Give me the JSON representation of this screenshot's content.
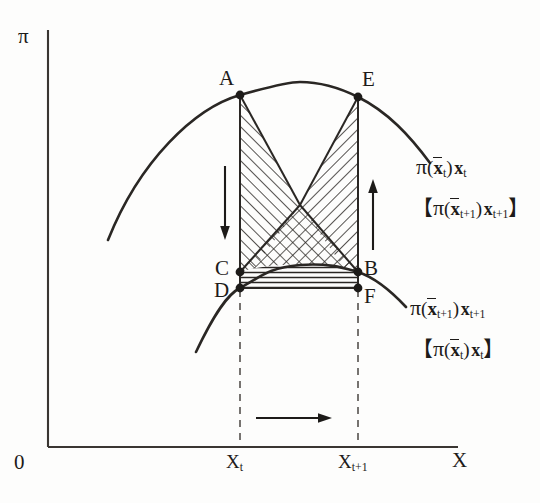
{
  "figure": {
    "type": "economics-profit-function-diagram",
    "background_color": "#fdfdfc",
    "ink_color": "#1d1b19"
  },
  "axes": {
    "y_axis_label": "π",
    "x_axis_label": "X",
    "origin_label": "0",
    "x_ticks": [
      {
        "label_main": "X",
        "label_sub": "t",
        "x_px": 240
      },
      {
        "label_main": "X",
        "label_sub": "t+1",
        "x_px": 358
      }
    ]
  },
  "points": [
    {
      "name": "A",
      "label": "A",
      "x_px": 240,
      "y_px": 95
    },
    {
      "name": "E",
      "label": "E",
      "x_px": 358,
      "y_px": 97
    },
    {
      "name": "C",
      "label": "C",
      "x_px": 240,
      "y_px": 272
    },
    {
      "name": "D",
      "label": "D",
      "x_px": 240,
      "y_px": 288
    },
    {
      "name": "B",
      "label": "B",
      "x_px": 358,
      "y_px": 272
    },
    {
      "name": "F",
      "label": "F",
      "x_px": 358,
      "y_px": 288
    }
  ],
  "curves": [
    {
      "name": "upper-profit-curve",
      "label_main": "π",
      "label_arg_x": "x",
      "label_arg_sub": "t",
      "label_tail_x": "x",
      "label_tail_sub": "t",
      "label_text": "π(x̄t) xt",
      "bracket_label_text": "【π(x̄t+1) xt+1】",
      "bracket_arg_sub": "t+1",
      "bracket_tail_sub": "t+1"
    },
    {
      "name": "lower-profit-curve",
      "label_main": "π",
      "label_arg_x": "x",
      "label_arg_sub": "t+1",
      "label_tail_x": "x",
      "label_tail_sub": "t+1",
      "label_text": "π(x̄t+1) xt+1",
      "bracket_label_text": "【π(x̄t) xt】",
      "bracket_arg_sub": "t",
      "bracket_tail_sub": "t"
    }
  ],
  "arrows": [
    {
      "name": "down-arrow-left",
      "direction": "down",
      "x_px": 225,
      "y_from": 166,
      "y_to": 237
    },
    {
      "name": "up-arrow-right",
      "direction": "up",
      "x_px": 373,
      "y_from": 250,
      "y_to": 182
    },
    {
      "name": "right-arrow-bottom",
      "direction": "right",
      "y_px": 418,
      "x_from": 256,
      "x_to": 331
    }
  ],
  "shaded_regions": [
    {
      "name": "region-A-C-apex",
      "pattern": "diagonal-hatch",
      "description": "triangle A-C-center"
    },
    {
      "name": "region-E-B-apex",
      "pattern": "diagonal-hatch",
      "description": "triangle E-B-center"
    },
    {
      "name": "region-C-B-triangle",
      "pattern": "cross-hatch",
      "description": "triangle C-B with upper apex"
    },
    {
      "name": "region-D-F-strip",
      "pattern": "horizontal-hatch",
      "description": "strip between lower curve and D-F"
    }
  ]
}
